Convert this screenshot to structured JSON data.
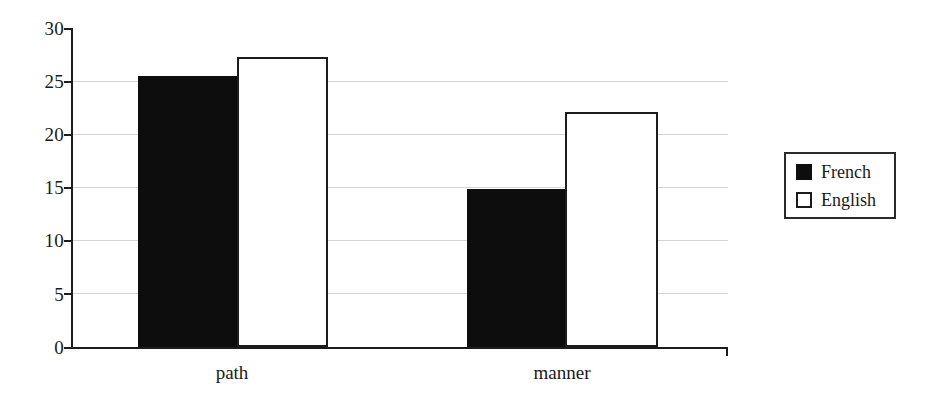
{
  "chart_data": {
    "type": "bar",
    "title": "",
    "subtitle": "",
    "xlabel": "",
    "ylabel": "",
    "categories": [
      "path",
      "manner"
    ],
    "series": [
      {
        "name": "French",
        "color": "#0d0d0d",
        "fill": "solid-black",
        "values": [
          25.5,
          14.9
        ]
      },
      {
        "name": "English",
        "color": "#ffffff",
        "fill": "white-outline",
        "values": [
          27.3,
          22.1
        ]
      }
    ],
    "ylim": [
      0,
      30
    ],
    "ytick_labels": [
      "0",
      "5",
      "10",
      "15",
      "20",
      "25",
      "30"
    ],
    "ytick_values": [
      0,
      5,
      10,
      15,
      20,
      25,
      30
    ],
    "grid": "horizontal",
    "grid_color": "#d4d4d4",
    "axis_color": "#1c1c1c",
    "legend_position": "right-outside",
    "legend_entries": [
      "French",
      "English"
    ]
  },
  "axis": {
    "y_ticks": [
      {
        "label": "30",
        "value": 30
      },
      {
        "label": "25",
        "value": 25
      },
      {
        "label": "20",
        "value": 20
      },
      {
        "label": "15",
        "value": 15
      },
      {
        "label": "10",
        "value": 10
      },
      {
        "label": "5",
        "value": 5
      },
      {
        "label": "0",
        "value": 0
      }
    ],
    "x_categories": [
      {
        "label": "path"
      },
      {
        "label": "manner"
      }
    ]
  },
  "legend": {
    "items": [
      {
        "label": "French",
        "swatch": "filled-black-square"
      },
      {
        "label": "English",
        "swatch": "outlined-white-square"
      }
    ]
  },
  "bars": [
    {
      "series": "French",
      "category": "path",
      "value": 25.5
    },
    {
      "series": "English",
      "category": "path",
      "value": 27.3
    },
    {
      "series": "French",
      "category": "manner",
      "value": 14.9
    },
    {
      "series": "English",
      "category": "manner",
      "value": 22.1
    }
  ]
}
